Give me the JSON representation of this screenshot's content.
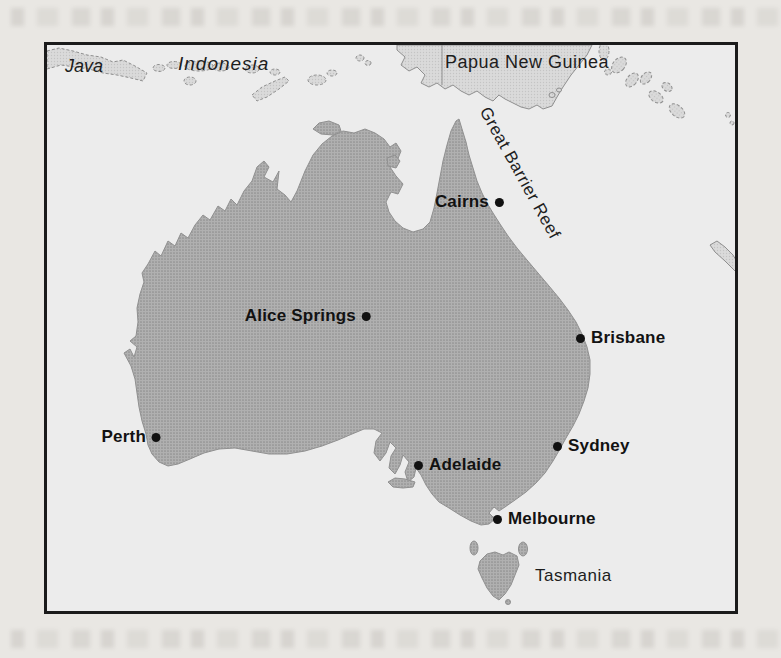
{
  "map": {
    "region_labels": [
      {
        "id": "java",
        "text": "Java"
      },
      {
        "id": "indonesia",
        "text": "Indonesia"
      },
      {
        "id": "papua-new-guinea",
        "text": "Papua New Guinea"
      },
      {
        "id": "great-barrier-reef",
        "text": "Great Barrier Reef"
      },
      {
        "id": "tasmania",
        "text": "Tasmania"
      }
    ],
    "cities": [
      {
        "name": "Cairns"
      },
      {
        "name": "Alice Springs"
      },
      {
        "name": "Brisbane"
      },
      {
        "name": "Perth"
      },
      {
        "name": "Adelaide"
      },
      {
        "name": "Sydney"
      },
      {
        "name": "Melbourne"
      }
    ],
    "colors": {
      "page_background": "#e9e7e3",
      "ocean": "#ececec",
      "australia_land": "#a8a8a8",
      "neighbor_islands": "#d6d6d6",
      "frame_border": "#1b1b1b",
      "label_text": "#1d1d1d",
      "city_dot": "#111111"
    }
  }
}
